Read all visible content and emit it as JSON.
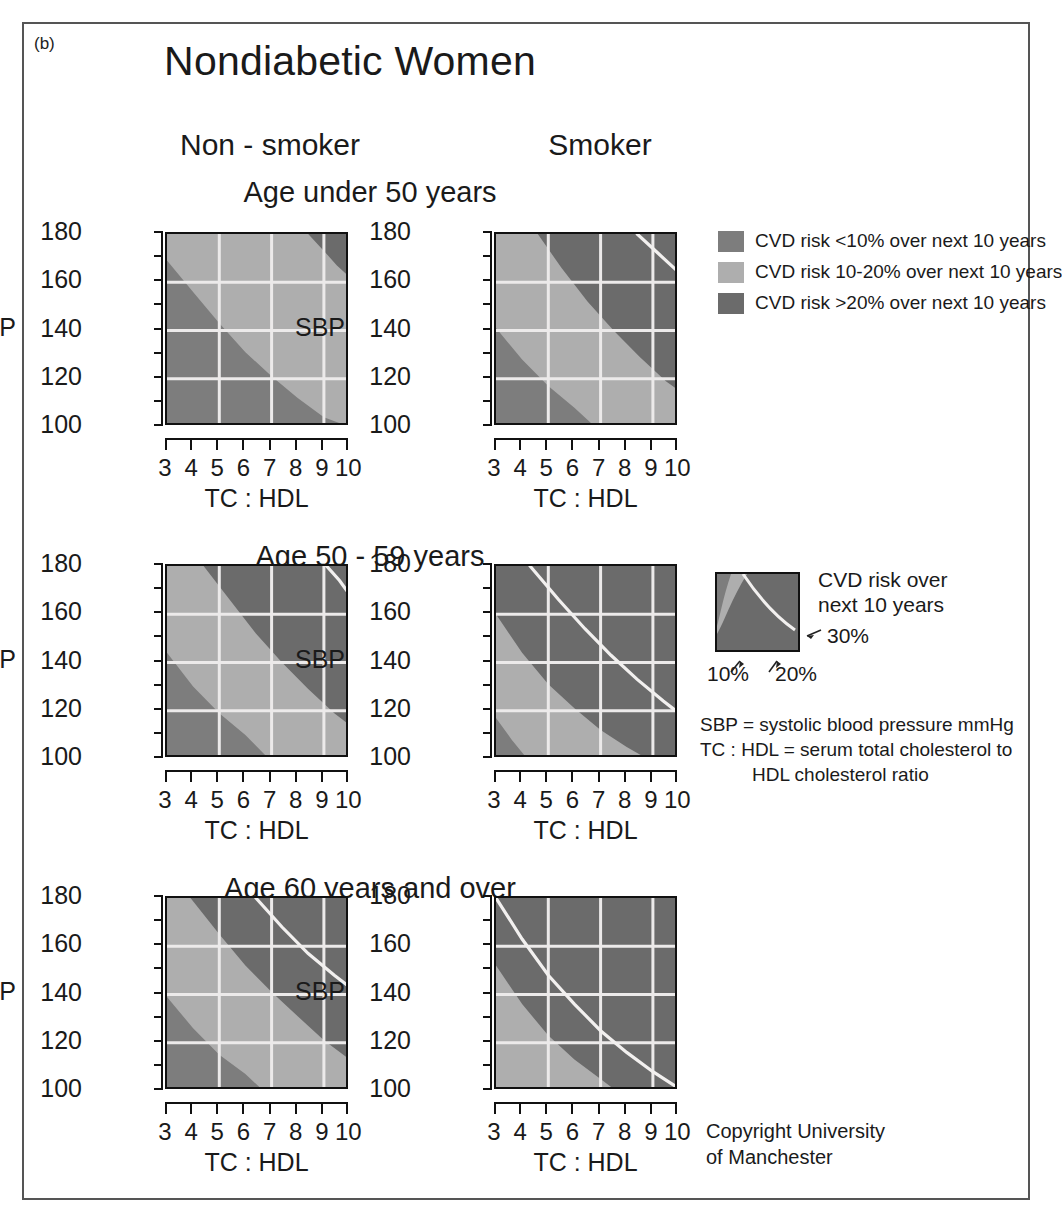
{
  "panel_letter": "(b)",
  "title": "Nondiabetic Women",
  "columns": {
    "left": "Non - smoker",
    "right": "Smoker"
  },
  "age_groups": [
    "Age under 50 years",
    "Age 50 - 59 years",
    "Age 60 years and over"
  ],
  "axes": {
    "y_title": "SBP",
    "x_title": "TC : HDL",
    "y_labels": [
      "180",
      "160",
      "140",
      "120",
      "100"
    ],
    "y_ticks": [
      100,
      110,
      120,
      130,
      140,
      150,
      160,
      170,
      180
    ],
    "x_labels": [
      "3",
      "4",
      "5",
      "6",
      "7",
      "8",
      "9",
      "10"
    ],
    "y_range": [
      100,
      180
    ],
    "x_range": [
      3,
      10
    ],
    "gridlines_x": [
      5,
      7,
      9
    ],
    "gridlines_y": [
      120,
      140,
      160
    ]
  },
  "colors": {
    "risk_low": "#7d7d7d",
    "risk_mid": "#aeaeae",
    "risk_high": "#6b6b6b",
    "gridline": "#eceaea",
    "contour": "#f2f0ef",
    "frame": "#555555",
    "text": "#1a1a1a"
  },
  "legend": {
    "items": [
      {
        "swatch": "risk_low",
        "label": "CVD risk <10% over next 10 years"
      },
      {
        "swatch": "risk_mid",
        "label": "CVD risk 10-20% over next 10 years"
      },
      {
        "swatch": "risk_high",
        "label": "CVD risk >20% over next 10 years"
      }
    ]
  },
  "inset": {
    "caption_line1": "CVD risk over",
    "caption_line2": "next 10 years",
    "label_30": "30%",
    "label_10": "10%",
    "label_20": "20%"
  },
  "definitions": {
    "line1": "SBP = systolic blood pressure mmHg",
    "line2": "TC : HDL = serum total cholesterol to",
    "line3": "HDL cholesterol ratio"
  },
  "copyright": {
    "line1": "Copyright University",
    "line2": "of Manchester"
  },
  "chart_data": {
    "type": "heatmap",
    "title": "Nondiabetic Women",
    "xlabel": "TC : HDL",
    "ylabel": "SBP",
    "xlim": [
      3,
      10
    ],
    "ylim": [
      100,
      180
    ],
    "grid": true,
    "legend_position": "right",
    "bands": [
      {
        "name": "CVD risk <10% over next 10 years",
        "color": "#7d7d7d"
      },
      {
        "name": "CVD risk 10-20% over next 10 years",
        "color": "#aeaeae"
      },
      {
        "name": "CVD risk >20% over next 10 years",
        "color": "#6b6b6b"
      }
    ],
    "contour_levels_percent": [
      10,
      20,
      30
    ],
    "panels": [
      {
        "id": "nonsmoker-under50",
        "row": "Age under 50 years",
        "column": "Non - smoker",
        "contour10": [
          [
            3,
            169
          ],
          [
            4,
            156
          ],
          [
            5,
            143
          ],
          [
            6,
            131
          ],
          [
            7,
            121
          ],
          [
            8,
            112
          ],
          [
            9,
            104
          ],
          [
            10,
            100
          ]
        ],
        "contour20": [
          [
            8.4,
            180
          ],
          [
            9,
            173
          ],
          [
            9.5,
            167
          ],
          [
            10,
            162
          ]
        ],
        "contour30": []
      },
      {
        "id": "smoker-under50",
        "row": "Age under 50 years",
        "column": "Smoker",
        "contour10": [
          [
            3,
            141
          ],
          [
            4,
            128
          ],
          [
            5,
            117
          ],
          [
            6,
            108
          ],
          [
            6.8,
            100
          ]
        ],
        "contour20": [
          [
            4.6,
            180
          ],
          [
            5.5,
            166
          ],
          [
            6.5,
            152
          ],
          [
            7.5,
            140
          ],
          [
            8.5,
            129
          ],
          [
            9.5,
            119
          ],
          [
            10,
            115
          ]
        ],
        "contour30": [
          [
            8.4,
            180
          ],
          [
            9.2,
            172
          ],
          [
            10,
            164
          ]
        ]
      },
      {
        "id": "nonsmoker-50-59",
        "row": "Age 50 - 59 years",
        "column": "Non - smoker",
        "contour10": [
          [
            3,
            144
          ],
          [
            4,
            130
          ],
          [
            5,
            119
          ],
          [
            6,
            110
          ],
          [
            6.9,
            100
          ]
        ],
        "contour20": [
          [
            4.4,
            180
          ],
          [
            5.4,
            166
          ],
          [
            6.4,
            152
          ],
          [
            7.4,
            140
          ],
          [
            8.4,
            129
          ],
          [
            9.4,
            119
          ],
          [
            10,
            114
          ]
        ],
        "contour30": [
          [
            9.1,
            180
          ],
          [
            9.6,
            174
          ],
          [
            10,
            168
          ]
        ]
      },
      {
        "id": "smoker-50-59",
        "row": "Age 50 - 59 years",
        "column": "Smoker",
        "contour10": [
          [
            3,
            117
          ],
          [
            3.6,
            108
          ],
          [
            4.2,
            100
          ]
        ],
        "contour20": [
          [
            3,
            160
          ],
          [
            4,
            144
          ],
          [
            5,
            131
          ],
          [
            6,
            121
          ],
          [
            7,
            112
          ],
          [
            8,
            105
          ],
          [
            8.8,
            100
          ]
        ],
        "contour30": [
          [
            4.3,
            180
          ],
          [
            5.4,
            166
          ],
          [
            6.4,
            154
          ],
          [
            7.4,
            143
          ],
          [
            8.4,
            133
          ],
          [
            9.4,
            124
          ],
          [
            10,
            119
          ]
        ]
      },
      {
        "id": "nonsmoker-60plus",
        "row": "Age 60 years and over",
        "column": "Non - smoker",
        "contour10": [
          [
            3,
            139
          ],
          [
            4,
            126
          ],
          [
            5,
            115
          ],
          [
            6,
            107
          ],
          [
            6.7,
            100
          ]
        ],
        "contour20": [
          [
            3.9,
            180
          ],
          [
            5,
            165
          ],
          [
            6,
            152
          ],
          [
            7,
            141
          ],
          [
            8,
            131
          ],
          [
            9,
            121
          ],
          [
            10,
            113
          ]
        ],
        "contour30": [
          [
            6.4,
            180
          ],
          [
            7.4,
            168
          ],
          [
            8.4,
            157
          ],
          [
            9.4,
            148
          ],
          [
            10,
            143
          ]
        ]
      },
      {
        "id": "smoker-60plus",
        "row": "Age 60 years and over",
        "column": "Smoker",
        "contour10": [],
        "contour20": [
          [
            3,
            152
          ],
          [
            4,
            136
          ],
          [
            5,
            123
          ],
          [
            6,
            113
          ],
          [
            7,
            105
          ],
          [
            7.6,
            100
          ]
        ],
        "contour30": [
          [
            3,
            180
          ],
          [
            4,
            163
          ],
          [
            5,
            148
          ],
          [
            6,
            136
          ],
          [
            7,
            125
          ],
          [
            8,
            116
          ],
          [
            9,
            108
          ],
          [
            10,
            101
          ]
        ]
      }
    ]
  }
}
